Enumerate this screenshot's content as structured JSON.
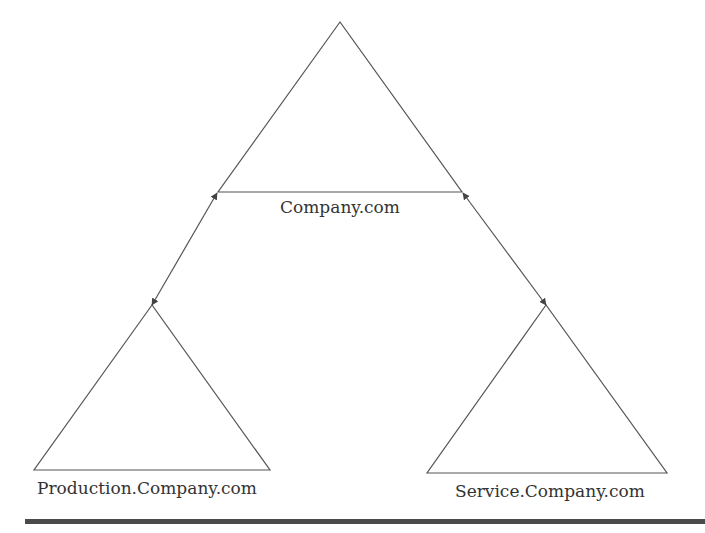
{
  "diagram": {
    "type": "domain-tree",
    "root": {
      "label": "Company.com"
    },
    "children": [
      {
        "label": "Production.Company.com"
      },
      {
        "label": "Service.Company.com"
      }
    ],
    "relationships": [
      {
        "from": "Company.com",
        "to": "Production.Company.com",
        "direction": "bidirectional"
      },
      {
        "from": "Company.com",
        "to": "Service.Company.com",
        "direction": "bidirectional"
      }
    ],
    "colors": {
      "line": "#555555",
      "text": "#333333",
      "rule": "#4a4a4a"
    }
  }
}
